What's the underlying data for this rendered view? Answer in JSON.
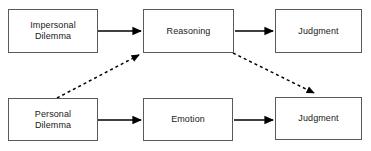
{
  "diagram": {
    "canvas": {
      "width": 371,
      "height": 151,
      "background": "#ffffff"
    },
    "style": {
      "box_border_color": "#5a5a5a",
      "box_fill_color": "#ffffff",
      "text_color": "#1a1a1a",
      "solid_edge_color": "#000000",
      "dashed_edge_color": "#000000",
      "dash_pattern": "3 3"
    },
    "nodes": [
      {
        "id": "impersonal-dilemma",
        "label": "Impersonal\nDilemma",
        "row": "top",
        "x": 8,
        "y": 9,
        "width": 90,
        "height": 44
      },
      {
        "id": "reasoning",
        "label": "Reasoning",
        "row": "top",
        "x": 143,
        "y": 9,
        "width": 91,
        "height": 44
      },
      {
        "id": "judgment-top",
        "label": "Judgment",
        "row": "top",
        "x": 275,
        "y": 9,
        "width": 87,
        "height": 44
      },
      {
        "id": "personal-dilemma",
        "label": "Personal\nDilemma",
        "row": "bottom",
        "x": 8,
        "y": 98,
        "width": 90,
        "height": 43
      },
      {
        "id": "emotion",
        "label": "Emotion",
        "row": "bottom",
        "x": 143,
        "y": 98,
        "width": 90,
        "height": 43
      },
      {
        "id": "judgment-bottom",
        "label": "Judgment",
        "row": "bottom",
        "x": 275,
        "y": 97,
        "width": 87,
        "height": 43
      }
    ],
    "edges": [
      {
        "id": "impersonal-to-reasoning",
        "from": "impersonal-dilemma",
        "to": "reasoning",
        "style": "solid",
        "x1": 98,
        "y1": 31,
        "x2": 142,
        "y2": 31
      },
      {
        "id": "reasoning-to-judgment-top",
        "from": "reasoning",
        "to": "judgment-top",
        "style": "solid",
        "x1": 235,
        "y1": 31,
        "x2": 274,
        "y2": 31
      },
      {
        "id": "personal-to-emotion",
        "from": "personal-dilemma",
        "to": "emotion",
        "style": "solid",
        "x1": 98,
        "y1": 120,
        "x2": 142,
        "y2": 120
      },
      {
        "id": "emotion-to-judgment-bottom",
        "from": "emotion",
        "to": "judgment-bottom",
        "style": "solid",
        "x1": 234,
        "y1": 120,
        "x2": 274,
        "y2": 120
      },
      {
        "id": "personal-to-reasoning",
        "from": "personal-dilemma",
        "to": "reasoning",
        "style": "dashed",
        "x1": 57,
        "y1": 98,
        "x2": 141,
        "y2": 54
      },
      {
        "id": "reasoning-to-judgment-bottom",
        "from": "reasoning",
        "to": "judgment-bottom",
        "style": "dashed",
        "x1": 233,
        "y1": 53,
        "x2": 316,
        "y2": 94
      }
    ]
  }
}
